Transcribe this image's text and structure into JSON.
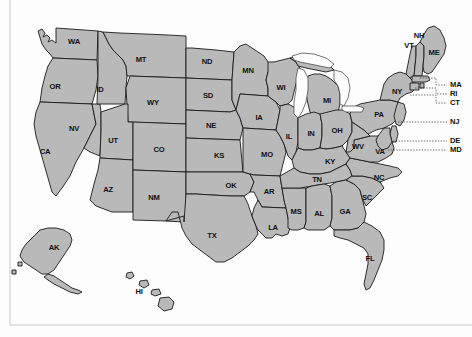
{
  "figure": {
    "type": "choropleth-outline-map",
    "fill_color": "#b9b9b9",
    "border_color": "#1a1a1a",
    "background_color": "#fdfdfd",
    "label_color": "#101010"
  },
  "states": [
    {
      "code": "WA",
      "label": "WA",
      "x": 74,
      "y": 42
    },
    {
      "code": "OR",
      "label": "OR",
      "x": 55,
      "y": 87
    },
    {
      "code": "CA",
      "label": "CA",
      "x": 45,
      "y": 152
    },
    {
      "code": "NV",
      "label": "NV",
      "x": 74,
      "y": 129
    },
    {
      "code": "ID",
      "label": "ID",
      "x": 100,
      "y": 90
    },
    {
      "code": "MT",
      "label": "MT",
      "x": 141,
      "y": 60
    },
    {
      "code": "WY",
      "label": "WY",
      "x": 153,
      "y": 103
    },
    {
      "code": "UT",
      "label": "UT",
      "x": 113,
      "y": 141
    },
    {
      "code": "AZ",
      "label": "AZ",
      "x": 108,
      "y": 190
    },
    {
      "code": "CO",
      "label": "CO",
      "x": 159,
      "y": 150
    },
    {
      "code": "NM",
      "label": "NM",
      "x": 154,
      "y": 198
    },
    {
      "code": "ND",
      "label": "ND",
      "x": 207,
      "y": 62
    },
    {
      "code": "SD",
      "label": "SD",
      "x": 208,
      "y": 96
    },
    {
      "code": "NE",
      "label": "NE",
      "x": 211,
      "y": 126
    },
    {
      "code": "KS",
      "label": "KS",
      "x": 219,
      "y": 156
    },
    {
      "code": "OK",
      "label": "OK",
      "x": 231,
      "y": 186
    },
    {
      "code": "TX",
      "label": "TX",
      "x": 212,
      "y": 236
    },
    {
      "code": "MN",
      "label": "MN",
      "x": 248,
      "y": 71
    },
    {
      "code": "IA",
      "label": "IA",
      "x": 259,
      "y": 118
    },
    {
      "code": "MO",
      "label": "MO",
      "x": 267,
      "y": 155
    },
    {
      "code": "AR",
      "label": "AR",
      "x": 269,
      "y": 192
    },
    {
      "code": "LA",
      "label": "LA",
      "x": 273,
      "y": 228
    },
    {
      "code": "WI",
      "label": "WI",
      "x": 281,
      "y": 88
    },
    {
      "code": "IL",
      "label": "IL",
      "x": 289,
      "y": 137
    },
    {
      "code": "MS",
      "label": "MS",
      "x": 296,
      "y": 212
    },
    {
      "code": "MI",
      "label": "MI",
      "x": 327,
      "y": 101
    },
    {
      "code": "IN",
      "label": "IN",
      "x": 311,
      "y": 134
    },
    {
      "code": "OH",
      "label": "OH",
      "x": 337,
      "y": 131
    },
    {
      "code": "KY",
      "label": "KY",
      "x": 330,
      "y": 162
    },
    {
      "code": "TN",
      "label": "TN",
      "x": 317,
      "y": 180
    },
    {
      "code": "AL",
      "label": "AL",
      "x": 319,
      "y": 214
    },
    {
      "code": "GA",
      "label": "GA",
      "x": 345,
      "y": 212
    },
    {
      "code": "FL",
      "label": "FL",
      "x": 370,
      "y": 259
    },
    {
      "code": "SC",
      "label": "SC",
      "x": 367,
      "y": 198
    },
    {
      "code": "NC",
      "label": "NC",
      "x": 379,
      "y": 178
    },
    {
      "code": "VA",
      "label": "VA",
      "x": 380,
      "y": 152
    },
    {
      "code": "WV",
      "label": "WV",
      "x": 358,
      "y": 147
    },
    {
      "code": "PA",
      "label": "PA",
      "x": 379,
      "y": 115
    },
    {
      "code": "NY",
      "label": "NY",
      "x": 397,
      "y": 92
    },
    {
      "code": "VT",
      "label": "VT",
      "x": 409,
      "y": 46
    },
    {
      "code": "NH",
      "label": "NH",
      "x": 419,
      "y": 36
    },
    {
      "code": "ME",
      "label": "ME",
      "x": 434,
      "y": 53
    },
    {
      "code": "AK",
      "label": "AK",
      "x": 54,
      "y": 248
    },
    {
      "code": "HI",
      "label": "HI",
      "x": 139,
      "y": 292
    }
  ],
  "callouts": [
    {
      "code": "MA",
      "label": "MA",
      "label_x": 450,
      "label_y": 85,
      "line": "420,78 436,78 436,85 447,85"
    },
    {
      "code": "RI",
      "label": "RI",
      "label_x": 450,
      "label_y": 94,
      "line": "415,88 436,88 436,94 447,94"
    },
    {
      "code": "CT",
      "label": "CT",
      "label_x": 450,
      "label_y": 103,
      "line": "410,95 436,95 436,103 447,103"
    },
    {
      "code": "NJ",
      "label": "NJ",
      "label_x": 450,
      "label_y": 122,
      "line": "398,122 447,122"
    },
    {
      "code": "DE",
      "label": "DE",
      "label_x": 450,
      "label_y": 141,
      "line": "393,141 447,141"
    },
    {
      "code": "MD",
      "label": "MD",
      "label_x": 450,
      "label_y": 150,
      "line": "388,150 447,150"
    }
  ],
  "lakes": [
    {
      "name": "lake-michigan"
    },
    {
      "name": "lake-superior"
    },
    {
      "name": "lake-huron"
    },
    {
      "name": "lake-erie"
    }
  ]
}
